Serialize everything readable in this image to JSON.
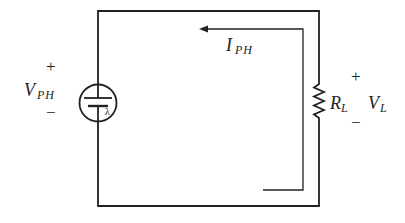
{
  "diagram": {
    "type": "circuit",
    "source": {
      "symbol": "photodiode-source",
      "label_main": "V",
      "label_sub": "PH",
      "plus": "+",
      "minus": "−",
      "lambda": "λ"
    },
    "current": {
      "label_main": "I",
      "label_sub": "PH"
    },
    "load": {
      "resistor_main": "R",
      "resistor_sub": "L",
      "voltage_main": "V",
      "voltage_sub": "L",
      "plus": "+",
      "minus": "−"
    },
    "colors": {
      "line": "#222222",
      "background": "#ffffff"
    }
  }
}
